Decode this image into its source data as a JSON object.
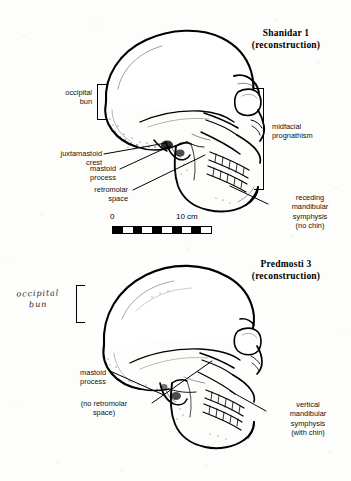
{
  "figure": {
    "background_color": "#fdfdfb",
    "ink_color": "#000000"
  },
  "panels": [
    {
      "id": "shanidar",
      "title": "Shanidar 1\n(reconstruction)",
      "specimen_name": "Shanidar 1",
      "title_note": "(reconstruction)",
      "labels": {
        "occipital_bun": "occipital\nbun",
        "juxtamastoid_crest": "juxtamastoid\ncrest",
        "mastoid_process": "mastoid\nprocess",
        "retromolar_space": "retromolar\nspace",
        "midfacial_prognathism": "midfacial\nprognathism",
        "mandibular_symphysis": "receding\nmandibular\nsymphysis\n(no chin)"
      },
      "scale": {
        "start": "0",
        "end": "10 cm",
        "segments": 10
      }
    },
    {
      "id": "predmosti",
      "title": "Predmosti 3\n(reconstruction)",
      "specimen_name": "Predmosti 3",
      "title_note": "(reconstruction)",
      "labels": {
        "occipital_bun_handwritten": "occipital\nbun",
        "mastoid_process": "mastoid\nprocess",
        "retromolar_space": "(no retromolar\nspace)",
        "mandibular_symphysis": "vertical\nmandibular\nsymphysis\n(with chin)"
      }
    }
  ]
}
